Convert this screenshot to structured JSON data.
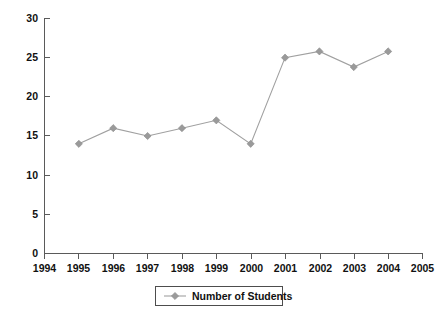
{
  "chart_data": {
    "type": "line",
    "title": "",
    "xlabel": "",
    "ylabel": "",
    "x": [
      1995,
      1996,
      1997,
      1998,
      1999,
      2000,
      2001,
      2002,
      2003,
      2004
    ],
    "values": [
      14,
      16,
      15,
      16,
      17,
      14,
      25,
      25.8,
      23.8,
      25.8
    ],
    "series": [
      {
        "name": "Number of Students",
        "values": [
          14,
          16,
          15,
          16,
          17,
          14,
          25,
          25.8,
          23.8,
          25.8
        ]
      }
    ],
    "x_tick_labels": [
      "1994",
      "1995",
      "1996",
      "1997",
      "1998",
      "1999",
      "2000",
      "2001",
      "2002",
      "2003",
      "2004",
      "2005"
    ],
    "y_tick_labels": [
      "0",
      "5",
      "10",
      "15",
      "20",
      "25",
      "30"
    ],
    "y_ticks": [
      0,
      5,
      10,
      15,
      20,
      25,
      30
    ],
    "xlim": [
      1994,
      2005
    ],
    "ylim": [
      0,
      30
    ],
    "grid": false,
    "legend_position": "bottom",
    "legend_entries": [
      "Number of Students"
    ],
    "marker": "diamond",
    "colors": {
      "series_line": "#a0a0a0",
      "marker_fill": "#9a9a9a",
      "axis": "#5a5a5a",
      "text": "#111111",
      "background": "#ffffff"
    }
  },
  "legend": {
    "label": "Number of Students"
  }
}
